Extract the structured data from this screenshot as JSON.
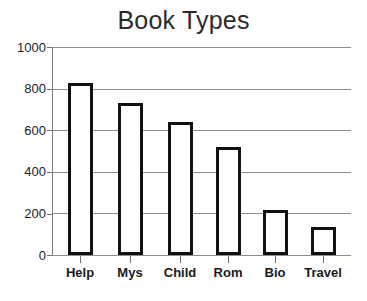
{
  "chart_data": {
    "type": "bar",
    "title": "Book Types",
    "xlabel": "",
    "ylabel": "",
    "categories": [
      "Help",
      "Mys",
      "Child",
      "Rom",
      "Bio",
      "Travel"
    ],
    "values": [
      825,
      730,
      640,
      520,
      215,
      135
    ],
    "ylim": [
      0,
      1000
    ],
    "ytick_labels": [
      "1000",
      "800",
      "600",
      "400",
      "200",
      "0"
    ],
    "ytick_values": [
      1000,
      800,
      600,
      400,
      200,
      0
    ],
    "grid": true,
    "legend": "none",
    "bar_style": {
      "fill_color": "#ffffff",
      "outline_color": "#111111",
      "outline_width_px": 3
    },
    "axis_color": "#7c7c7c",
    "gridline_color": "#8d8d8d",
    "text_color": "#1d1d1d",
    "background_color": "#ffffff"
  }
}
